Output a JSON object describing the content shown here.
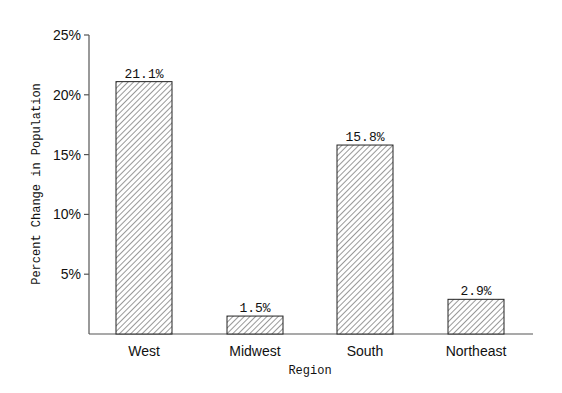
{
  "chart_data": {
    "type": "bar",
    "title": "",
    "xlabel": "Region",
    "ylabel": "Percent Change in Population",
    "categories": [
      "West",
      "Midwest",
      "South",
      "Northeast"
    ],
    "values": [
      21.1,
      1.5,
      15.8,
      2.9
    ],
    "value_labels": [
      "21.1%",
      "1.5%",
      "15.8%",
      "2.9%"
    ],
    "ylim": [
      0,
      25
    ],
    "yticks": [
      5,
      10,
      15,
      20,
      25
    ],
    "ytick_labels": [
      "5%",
      "10%",
      "15%",
      "20%",
      "25%"
    ],
    "grid": false,
    "legend": null,
    "bar_style": "diagonal hatch, black outline, white fill"
  },
  "colors": {
    "axis": "#555555",
    "bar_outline": "#222222",
    "hatch": "#333333",
    "background": "#ffffff"
  }
}
